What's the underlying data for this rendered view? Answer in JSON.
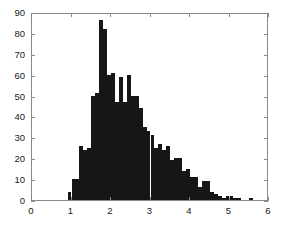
{
  "figure": {
    "background_color": "#ffffff",
    "axis_color": "#8a8a8a",
    "bar_color": "#161616",
    "text_color": "#1a1a1a"
  },
  "chart_data": {
    "type": "bar",
    "title": "",
    "subtitle": "",
    "xlabel": "",
    "ylabel": "",
    "xlim": [
      0,
      6
    ],
    "ylim": [
      0,
      90
    ],
    "grid": false,
    "legend": null,
    "xticks": [
      0,
      1,
      2,
      3,
      4,
      5,
      6
    ],
    "xtick_labels": [
      "0",
      "1",
      "2",
      "3",
      "4",
      "5",
      "6"
    ],
    "yticks": [
      0,
      10,
      20,
      30,
      40,
      50,
      60,
      70,
      80,
      90
    ],
    "ytick_labels": [
      "0",
      "10",
      "20",
      "30",
      "40",
      "50",
      "60",
      "70",
      "80",
      "90"
    ],
    "bin_width": 0.1,
    "bin_starts": [
      0.9,
      1.0,
      1.1,
      1.2,
      1.3,
      1.4,
      1.5,
      1.6,
      1.7,
      1.8,
      1.9,
      2.0,
      2.1,
      2.2,
      2.3,
      2.4,
      2.5,
      2.6,
      2.7,
      2.8,
      2.9,
      3.0,
      3.1,
      3.2,
      3.3,
      3.4,
      3.5,
      3.6,
      3.7,
      3.8,
      3.9,
      4.0,
      4.1,
      4.2,
      4.3,
      4.4,
      4.5,
      4.6,
      4.7,
      4.8,
      4.9,
      5.0,
      5.1,
      5.2,
      5.5
    ],
    "bin_centers": [
      0.95,
      1.05,
      1.15,
      1.25,
      1.35,
      1.45,
      1.55,
      1.65,
      1.75,
      1.85,
      1.95,
      2.05,
      2.15,
      2.25,
      2.35,
      2.45,
      2.55,
      2.65,
      2.75,
      2.85,
      2.95,
      3.05,
      3.15,
      3.25,
      3.35,
      3.45,
      3.55,
      3.65,
      3.75,
      3.85,
      3.95,
      4.05,
      4.15,
      4.25,
      4.35,
      4.45,
      4.55,
      4.65,
      4.75,
      4.85,
      4.95,
      5.05,
      5.15,
      5.25,
      5.55
    ],
    "categories": [
      "0.9",
      "1.0",
      "1.1",
      "1.2",
      "1.3",
      "1.4",
      "1.5",
      "1.6",
      "1.7",
      "1.8",
      "1.9",
      "2.0",
      "2.1",
      "2.2",
      "2.3",
      "2.4",
      "2.5",
      "2.6",
      "2.7",
      "2.8",
      "2.9",
      "3.0",
      "3.1",
      "3.2",
      "3.3",
      "3.4",
      "3.5",
      "3.6",
      "3.7",
      "3.8",
      "3.9",
      "4.0",
      "4.1",
      "4.2",
      "4.3",
      "4.4",
      "4.5",
      "4.6",
      "4.7",
      "4.8",
      "4.9",
      "5.0",
      "5.1",
      "5.2",
      "5.5"
    ],
    "values": [
      4,
      10,
      10,
      26,
      24,
      25,
      50,
      51,
      86,
      82,
      60,
      61,
      47,
      59,
      47,
      60,
      50,
      50,
      44,
      35,
      33,
      31,
      25,
      27,
      24,
      26,
      19,
      20,
      20,
      14,
      15,
      11,
      11,
      6,
      9,
      9,
      4,
      3,
      2,
      1,
      2,
      2,
      1,
      1,
      1
    ],
    "max_value": 86,
    "max_value_bin": "1.7"
  }
}
